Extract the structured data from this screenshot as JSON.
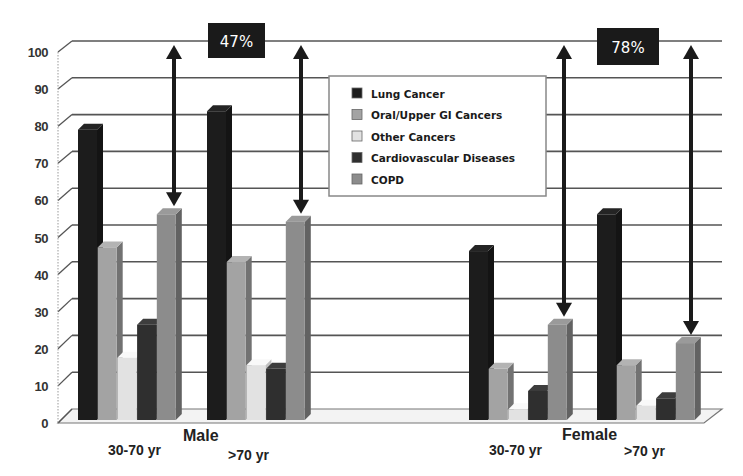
{
  "chart_data": {
    "type": "bar",
    "subtype": "3d-clustered-bar",
    "title": "",
    "xlabel": "",
    "ylabel": "",
    "ylim": [
      0,
      100
    ],
    "yticks": [
      0,
      10,
      20,
      30,
      40,
      50,
      60,
      70,
      80,
      90,
      100
    ],
    "grid": true,
    "legend_position": "top-center (inside plot)",
    "groups": [
      "Male",
      "Female"
    ],
    "categories": [
      "Male 30-70 yr",
      "Male >70 yr",
      "Female 30-70 yr",
      "Female >70 yr"
    ],
    "category_labels": [
      "30-70 yr",
      ">70 yr",
      "30-70 yr",
      ">70 yr"
    ],
    "series": [
      {
        "name": "Lung Cancer",
        "color": "#1c1c1c",
        "values": [
          77,
          82,
          44,
          54
        ]
      },
      {
        "name": "Oral/Upper GI Cancers",
        "color": "#a3a3a3",
        "values": [
          45,
          41,
          12,
          13
        ]
      },
      {
        "name": "Other Cancers",
        "color": "#e2e2e2",
        "values": [
          15,
          13,
          1,
          2
        ]
      },
      {
        "name": "Cardiovascular Diseases",
        "color": "#2f2f2f",
        "values": [
          24,
          12,
          6,
          4
        ]
      },
      {
        "name": "COPD",
        "color": "#8c8c8c",
        "values": [
          54,
          52,
          24,
          19
        ]
      }
    ],
    "annotations": [
      {
        "text": "47%",
        "type": "callout",
        "group": "Male",
        "description": "Double-headed arrows from 100 down to COPD bar tops for Male 30-70 yr and Male >70 yr"
      },
      {
        "text": "78%",
        "type": "callout",
        "group": "Female",
        "description": "Double-headed arrows from 100 down to COPD bar tops for Female 30-70 yr and Female >70 yr"
      }
    ]
  },
  "axis": {
    "y_ticks": [
      "0",
      "10",
      "20",
      "30",
      "40",
      "50",
      "60",
      "70",
      "80",
      "90",
      "100"
    ]
  },
  "labels": {
    "male": "Male",
    "female": "Female",
    "male_young": "30-70 yr",
    "male_old": ">70 yr",
    "female_young": "30-70 yr",
    "female_old": ">70 yr"
  },
  "legend": {
    "items": [
      {
        "label": "Lung Cancer",
        "color": "#1c1c1c"
      },
      {
        "label": "Oral/Upper GI Cancers",
        "color": "#a3a3a3"
      },
      {
        "label": "Other Cancers",
        "color": "#e2e2e2"
      },
      {
        "label": "Cardiovascular Diseases",
        "color": "#2f2f2f"
      },
      {
        "label": "COPD",
        "color": "#8c8c8c"
      }
    ]
  },
  "callouts": {
    "male": "47%",
    "female": "78%"
  }
}
